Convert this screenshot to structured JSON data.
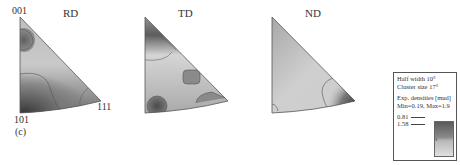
{
  "figure": {
    "panel_label": "(c)",
    "corner_labels": {
      "top": "001",
      "bottom_left": "101",
      "right": "111"
    },
    "plots": [
      {
        "title": "RD"
      },
      {
        "title": "TD"
      },
      {
        "title": "ND"
      }
    ],
    "legend": {
      "half_width": "Half width 10°",
      "cluster_size": "Cluster size 17°",
      "densities_label": "Exp. densities [mud]",
      "min_max": "Min=0.19, Max=1.9",
      "contour_levels": [
        "0.81",
        "1.58"
      ],
      "colorbar_tick": "1"
    }
  }
}
